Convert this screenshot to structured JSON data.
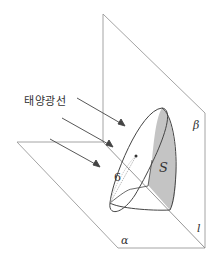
{
  "diagram": {
    "title_label": "태양광선",
    "labels": {
      "plane_beta": "β",
      "plane_alpha": "α",
      "line_l": "l",
      "area_s": "S",
      "radius": "6"
    },
    "colors": {
      "line": "#555555",
      "plane_line": "#9a9a9a",
      "shade": "#c4c4c4"
    }
  }
}
